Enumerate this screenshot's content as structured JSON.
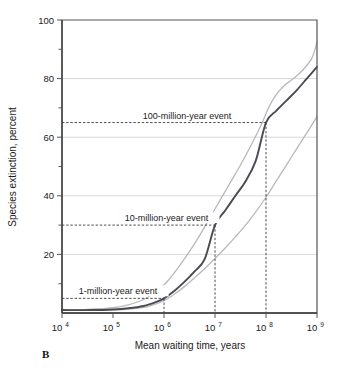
{
  "figure": {
    "panel_label": "B"
  },
  "chart_data": {
    "type": "line",
    "title": "",
    "xlabel": "Mean waiting time, years",
    "ylabel": "Species extinction, percent",
    "xscale": "log",
    "xlim": [
      10000,
      1000000000
    ],
    "ylim": [
      0,
      100
    ],
    "grid": true,
    "grid_axis": "y",
    "legend_position": "none",
    "xticks": [
      {
        "value": 10000,
        "base": "10",
        "exp": "4"
      },
      {
        "value": 100000,
        "base": "10",
        "exp": "5"
      },
      {
        "value": 1000000,
        "base": "10",
        "exp": "6"
      },
      {
        "value": 10000000,
        "base": "10",
        "exp": "7"
      },
      {
        "value": 100000000,
        "base": "10",
        "exp": "8"
      },
      {
        "value": 1000000000,
        "base": "10",
        "exp": "9"
      }
    ],
    "yticks_major": [
      20,
      40,
      60,
      80,
      100
    ],
    "yticks_minor": [
      10,
      30,
      50,
      70,
      90
    ],
    "series": [
      {
        "name": "upper bound",
        "style": "light-gray",
        "points": [
          [
            4.0,
            1.0
          ],
          [
            4.5,
            1.2
          ],
          [
            5.0,
            1.8
          ],
          [
            5.3,
            2.8
          ],
          [
            5.6,
            4.6
          ],
          [
            5.9,
            8.0
          ],
          [
            6.1,
            11.5
          ],
          [
            6.3,
            16.0
          ],
          [
            6.5,
            21.0
          ],
          [
            6.7,
            26.5
          ],
          [
            6.9,
            32.5
          ],
          [
            7.1,
            38.5
          ],
          [
            7.3,
            44.5
          ],
          [
            7.5,
            50.5
          ],
          [
            7.7,
            57.0
          ],
          [
            7.9,
            64.0
          ],
          [
            8.05,
            70.0
          ],
          [
            8.2,
            74.5
          ],
          [
            8.35,
            77.5
          ],
          [
            8.5,
            79.5
          ],
          [
            8.7,
            82.5
          ],
          [
            8.9,
            87.0
          ],
          [
            9.0,
            92.5
          ]
        ]
      },
      {
        "name": "mean curve",
        "style": "dark",
        "points": [
          [
            4.0,
            1.0
          ],
          [
            4.6,
            1.0
          ],
          [
            5.0,
            1.2
          ],
          [
            5.3,
            1.6
          ],
          [
            5.6,
            2.4
          ],
          [
            5.85,
            3.8
          ],
          [
            6.0,
            5.0
          ],
          [
            6.2,
            7.5
          ],
          [
            6.4,
            10.6
          ],
          [
            6.6,
            14.2
          ],
          [
            6.8,
            18.5
          ],
          [
            7.0,
            30.0
          ],
          [
            7.2,
            35.0
          ],
          [
            7.4,
            40.0
          ],
          [
            7.6,
            45.0
          ],
          [
            7.8,
            52.0
          ],
          [
            8.0,
            65.0
          ],
          [
            8.2,
            69.0
          ],
          [
            8.4,
            72.5
          ],
          [
            8.6,
            76.0
          ],
          [
            8.8,
            80.0
          ],
          [
            9.0,
            84.0
          ]
        ]
      },
      {
        "name": "lower bound",
        "style": "light-gray",
        "points": [
          [
            4.0,
            1.0
          ],
          [
            5.0,
            1.1
          ],
          [
            5.4,
            1.5
          ],
          [
            5.7,
            2.3
          ],
          [
            6.0,
            4.2
          ],
          [
            6.2,
            6.4
          ],
          [
            6.4,
            9.0
          ],
          [
            6.6,
            12.0
          ],
          [
            6.8,
            15.2
          ],
          [
            7.0,
            18.6
          ],
          [
            7.2,
            22.2
          ],
          [
            7.4,
            26.0
          ],
          [
            7.6,
            30.0
          ],
          [
            7.8,
            34.5
          ],
          [
            8.0,
            39.5
          ],
          [
            8.2,
            45.0
          ],
          [
            8.4,
            50.5
          ],
          [
            8.6,
            56.0
          ],
          [
            8.8,
            61.5
          ],
          [
            9.0,
            67.0
          ]
        ]
      }
    ],
    "annotations": [
      {
        "id": "event-100my",
        "label": "100-million-year event",
        "x_value": 100000000,
        "x_log": 8.0,
        "y_value": 65,
        "text_anchor_log": 6.45
      },
      {
        "id": "event-10my",
        "label": "10-million-year event",
        "x_value": 10000000,
        "x_log": 7.0,
        "y_value": 30,
        "text_anchor_log": 6.05
      },
      {
        "id": "event-1my",
        "label": "1-million-year event",
        "x_value": 1000000,
        "x_log": 6.0,
        "y_value": 5,
        "text_anchor_log": 5.1
      }
    ],
    "colors": {
      "main_curve": "#4a4a52",
      "bound_curve": "#b9b9bd",
      "gridline": "#c9c9c9",
      "axis": "#555555",
      "text": "#1a1a1a"
    }
  }
}
